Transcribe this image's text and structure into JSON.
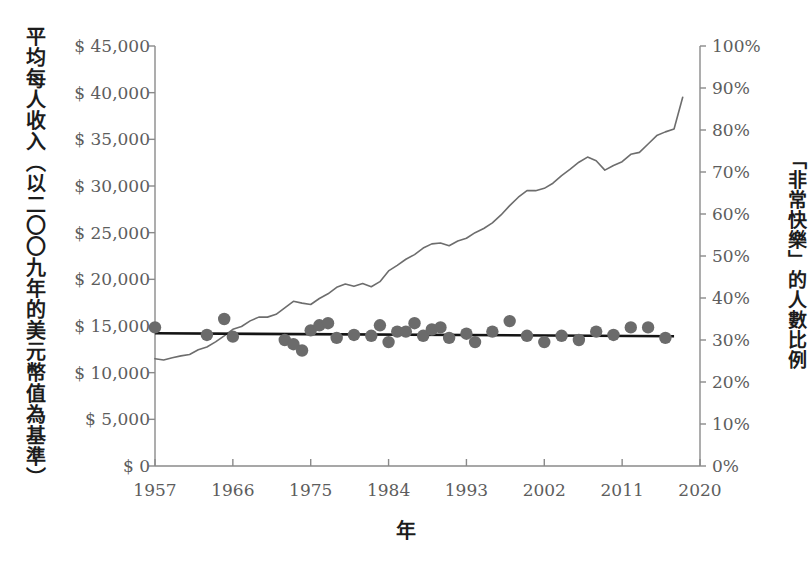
{
  "axes": {
    "left_title": "平均每人收入（以二〇〇九年的美元幣值為基準）",
    "right_title": "「非常快樂」的人數比例",
    "x_title": "年",
    "left_ticks": [
      "$ 45,000",
      "$ 40,000",
      "$ 35,000",
      "$ 30,000",
      "$ 25,000",
      "$ 20,000",
      "$ 15,000",
      "$ 10,000",
      "$ 5,000",
      "$ 0"
    ],
    "right_ticks": [
      "100%",
      "90%",
      "80%",
      "70%",
      "60%",
      "50%",
      "40%",
      "30%",
      "20%",
      "10%",
      "0%"
    ],
    "x_ticks": [
      "1957",
      "1966",
      "1975",
      "1984",
      "1993",
      "2002",
      "2011",
      "2020"
    ]
  },
  "colors": {
    "line": "#6d6d6d",
    "dot": "#6b6b6b",
    "trend": "#141414",
    "axis": "#8a8a8a",
    "tick_text": "#5d5d5d",
    "title_text": "#1c1c1c",
    "background": "#ffffff"
  },
  "chart_data": {
    "type": "line",
    "title": "",
    "subtitle": "",
    "xlabel": "年",
    "ylabel": "平均每人收入（以二〇〇九年的美元幣值為基準）",
    "y2label": "「非常快樂」的人數比例",
    "xlim": [
      1957,
      2020
    ],
    "ylim": [
      0,
      45000
    ],
    "y2lim": [
      0,
      100
    ],
    "xticks": [
      1957,
      1966,
      1975,
      1984,
      1993,
      2002,
      2011,
      2020
    ],
    "yticks": [
      0,
      5000,
      10000,
      15000,
      20000,
      25000,
      30000,
      35000,
      40000,
      45000
    ],
    "y2ticks": [
      0,
      10,
      20,
      30,
      40,
      50,
      60,
      70,
      80,
      90,
      100
    ],
    "grid": false,
    "legend": "none",
    "series": [
      {
        "name": "平均每人收入",
        "type": "line",
        "axis": "left",
        "unit": "2009 USD",
        "x": [
          1957,
          1958,
          1959,
          1960,
          1961,
          1962,
          1963,
          1964,
          1965,
          1966,
          1967,
          1968,
          1969,
          1970,
          1971,
          1972,
          1973,
          1974,
          1975,
          1976,
          1977,
          1978,
          1979,
          1980,
          1981,
          1982,
          1983,
          1984,
          1985,
          1986,
          1987,
          1988,
          1989,
          1990,
          1991,
          1992,
          1993,
          1994,
          1995,
          1996,
          1997,
          1998,
          1999,
          2000,
          2001,
          2002,
          2003,
          2004,
          2005,
          2006,
          2007,
          2008,
          2009,
          2010,
          2011,
          2012,
          2013,
          2014,
          2015,
          2016,
          2017
        ],
        "values": [
          11500,
          11350,
          11600,
          11800,
          11950,
          12450,
          12750,
          13300,
          13950,
          14650,
          14950,
          15550,
          15950,
          15950,
          16250,
          16950,
          17650,
          17450,
          17300,
          17950,
          18450,
          19150,
          19500,
          19250,
          19550,
          19200,
          19750,
          20900,
          21500,
          22150,
          22650,
          23350,
          23800,
          23900,
          23600,
          24100,
          24400,
          25000,
          25450,
          26050,
          26900,
          27900,
          28800,
          29500,
          29500,
          29750,
          30300,
          31100,
          31800,
          32550,
          33100,
          32700,
          31700,
          32200,
          32600,
          33400,
          33600,
          34500,
          35400,
          35800,
          36100
        ],
        "value_labels_shown": false,
        "endpoint_value": 39500
      },
      {
        "name": "「非常快樂」的人數比例",
        "type": "scatter",
        "axis": "right",
        "unit": "%",
        "x": [
          1957,
          1963,
          1965,
          1966,
          1972,
          1973,
          1974,
          1975,
          1976,
          1977,
          1978,
          1980,
          1982,
          1983,
          1984,
          1985,
          1986,
          1987,
          1988,
          1989,
          1990,
          1991,
          1993,
          1994,
          1996,
          1998,
          2000,
          2002,
          2004,
          2006,
          2008,
          2010,
          2012,
          2014,
          2016
        ],
        "values": [
          33.0,
          31.2,
          35.0,
          30.8,
          30.0,
          29.0,
          27.5,
          32.3,
          33.5,
          34.0,
          30.5,
          31.2,
          31.0,
          33.5,
          29.5,
          32.0,
          32.0,
          34.0,
          31.0,
          32.5,
          33.0,
          30.5,
          31.5,
          29.5,
          32.0,
          34.5,
          31.0,
          29.5,
          31.0,
          30.0,
          32.0,
          31.2,
          33.0,
          33.0,
          30.5
        ]
      },
      {
        "name": "快樂趨勢線",
        "type": "trendline",
        "axis": "right",
        "unit": "%",
        "x": [
          1957,
          2017
        ],
        "values": [
          31.6,
          30.9
        ]
      }
    ]
  }
}
